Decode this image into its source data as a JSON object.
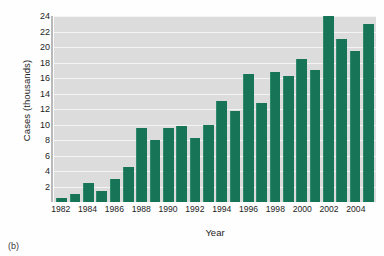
{
  "chart_data": {
    "type": "bar",
    "title": "",
    "xlabel": "Year",
    "ylabel": "Cases (thousands)",
    "ylim": [
      0,
      24
    ],
    "ytick_step": 2,
    "yticks": [
      24,
      22,
      20,
      18,
      16,
      14,
      12,
      10,
      8,
      6,
      4,
      2
    ],
    "grid": true,
    "legend": "none",
    "bar_color": "#177457",
    "plot_background": "#dcdcdc",
    "gridline_color": "#f4f4f4",
    "categories": [
      "1982",
      "1983",
      "1984",
      "1985",
      "1986",
      "1987",
      "1988",
      "1989",
      "1990",
      "1991",
      "1992",
      "1993",
      "1994",
      "1995",
      "1996",
      "1997",
      "1998",
      "1999",
      "2000",
      "2001",
      "2002",
      "2003",
      "2004",
      "2005"
    ],
    "xtick_labels": [
      "1982",
      "1984",
      "1986",
      "1988",
      "1990",
      "1992",
      "1994",
      "1996",
      "1998",
      "2000",
      "2002",
      "2004"
    ],
    "values": [
      0.5,
      1.0,
      2.5,
      1.4,
      3.0,
      4.5,
      9.5,
      8.0,
      9.5,
      9.8,
      8.3,
      9.9,
      13.0,
      11.8,
      16.5,
      12.8,
      16.8,
      16.3,
      18.5,
      17.0,
      24.0,
      21.0,
      19.5,
      23.0
    ]
  },
  "figure": {
    "caption": "(b)"
  }
}
